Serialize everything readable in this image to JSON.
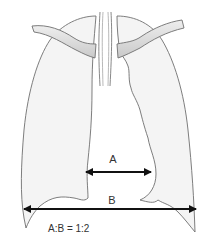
{
  "diagram": {
    "labels": {
      "a": "A",
      "b": "B",
      "ratio": "A:B = 1:2"
    },
    "parts": [
      "right-lung",
      "left-lung",
      "right-clavicle",
      "left-clavicle",
      "trachea",
      "heart-silhouette"
    ],
    "measurements": [
      {
        "name": "A",
        "description": "Cardiac width"
      },
      {
        "name": "B",
        "description": "Thoracic width"
      }
    ],
    "colors": {
      "outline": "#6f6f6f",
      "lung_fill": "#f4f4f4",
      "bone_fill": "#d9d9d9",
      "arrow": "#111111",
      "text": "#333333"
    }
  }
}
